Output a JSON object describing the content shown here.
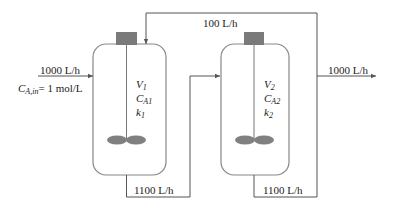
{
  "diagram": {
    "type": "two CSTRs in series with recycle",
    "inlet": {
      "flow_label": "1000 L/h",
      "concentration_symbol": "C",
      "concentration_sub": "A,in",
      "concentration_value": "= 1 mol/L"
    },
    "recycle": {
      "flow_label": "100 L/h"
    },
    "outlet": {
      "flow_label": "1000 L/h"
    },
    "reactors": [
      {
        "id": "reactor-1",
        "volume_symbol": "V",
        "volume_sub": "1",
        "conc_symbol": "C",
        "conc_sub": "A1",
        "rate_symbol": "k",
        "rate_sub": "1",
        "outflow_label": "1100 L/h"
      },
      {
        "id": "reactor-2",
        "volume_symbol": "V",
        "volume_sub": "2",
        "conc_symbol": "C",
        "conc_sub": "A2",
        "rate_symbol": "k",
        "rate_sub": "2",
        "outflow_label": "1100 L/h"
      }
    ],
    "colors": {
      "line": "#555555",
      "tank_outline": "#888888",
      "motor": "#7a7a7a",
      "impeller": "#808080"
    }
  }
}
